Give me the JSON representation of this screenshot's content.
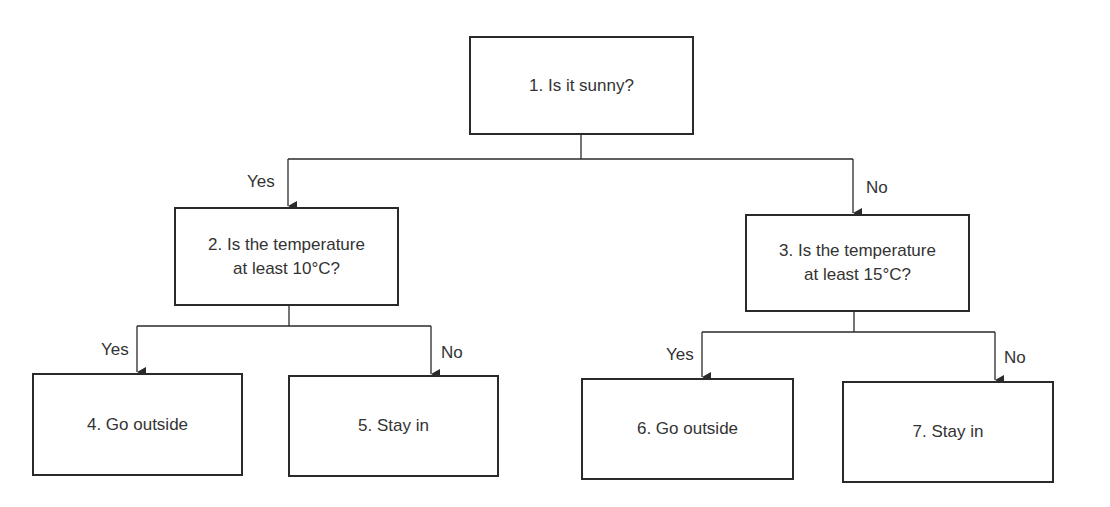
{
  "diagram": {
    "type": "decision-tree",
    "nodes": [
      {
        "id": 1,
        "label": "1. Is it sunny?"
      },
      {
        "id": 2,
        "label": "2. Is the temperature at least 10°C?"
      },
      {
        "id": 3,
        "label": "3. Is the temperature at least 15°C?"
      },
      {
        "id": 4,
        "label": "4. Go outside"
      },
      {
        "id": 5,
        "label": "5. Stay in"
      },
      {
        "id": 6,
        "label": "6. Go outside"
      },
      {
        "id": 7,
        "label": "7. Stay in"
      }
    ],
    "edges": [
      {
        "from": 1,
        "to": 2,
        "label": "Yes"
      },
      {
        "from": 1,
        "to": 3,
        "label": "No"
      },
      {
        "from": 2,
        "to": 4,
        "label": "Yes"
      },
      {
        "from": 2,
        "to": 5,
        "label": "No"
      },
      {
        "from": 3,
        "to": 6,
        "label": "Yes"
      },
      {
        "from": 3,
        "to": 7,
        "label": "No"
      }
    ],
    "line_color": "#2a2a2a",
    "text_color": "#333333"
  }
}
